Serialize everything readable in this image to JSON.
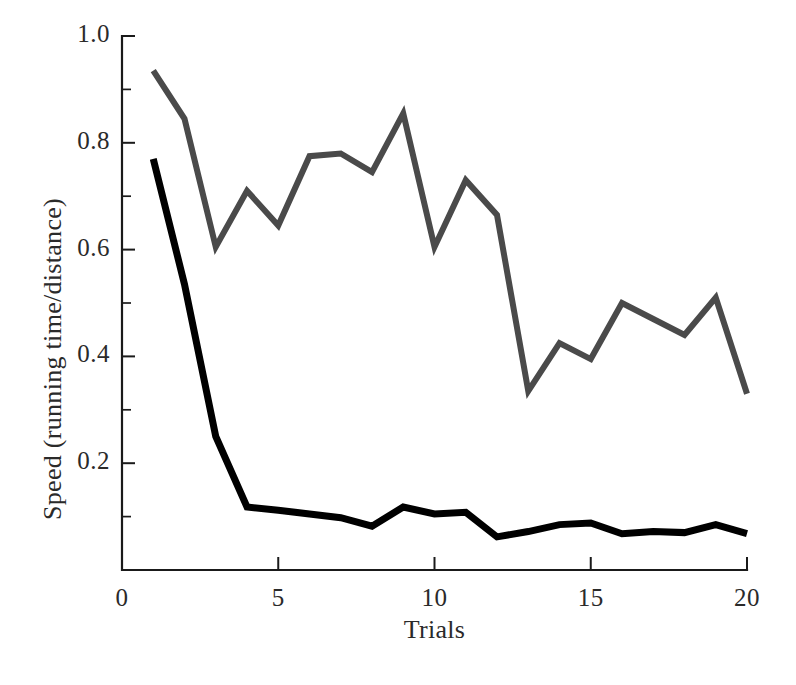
{
  "chart_data": {
    "type": "line",
    "title": "",
    "xlabel": "Trials",
    "ylabel": "Speed (running time/distance)",
    "xlim": [
      0,
      20
    ],
    "ylim": [
      0,
      1.0
    ],
    "grid": false,
    "legend": "none",
    "x_ticks": [
      "0",
      "5",
      "10",
      "15",
      "20"
    ],
    "x_tick_values": [
      0,
      5,
      10,
      15,
      20
    ],
    "x_minor_ticks": [],
    "y_ticks": [
      "0.2",
      "0.4",
      "0.6",
      "0.8",
      "1.0"
    ],
    "y_tick_values": [
      0.2,
      0.4,
      0.6,
      0.8,
      1.0
    ],
    "y_minor_tick_values": [
      0.1,
      0.3,
      0.5,
      0.7,
      0.9
    ],
    "x": [
      1,
      2,
      3,
      4,
      5,
      6,
      7,
      8,
      9,
      10,
      11,
      12,
      13,
      14,
      15,
      16,
      17,
      18,
      19,
      20
    ],
    "series": [
      {
        "name": "upper-gray-series",
        "color": "#4a4a4a",
        "stroke_width": 6,
        "values": [
          0.935,
          0.845,
          0.605,
          0.71,
          0.645,
          0.775,
          0.78,
          0.745,
          0.855,
          0.605,
          0.73,
          0.665,
          0.335,
          0.425,
          0.395,
          0.5,
          0.47,
          0.44,
          0.51,
          0.33
        ]
      },
      {
        "name": "lower-black-series",
        "color": "#000000",
        "stroke_width": 7,
        "values": [
          0.77,
          0.535,
          0.25,
          0.118,
          0.112,
          0.105,
          0.098,
          0.082,
          0.118,
          0.105,
          0.108,
          0.062,
          0.072,
          0.085,
          0.088,
          0.068,
          0.072,
          0.07,
          0.085,
          0.068
        ]
      }
    ]
  },
  "axes": {
    "y_axis_title": "Speed (running time/distance)",
    "x_axis_title": "Trials"
  },
  "colors": {
    "gray_series": "#4a4a4a",
    "black_series": "#000000",
    "axis": "#1a1a1a",
    "background": "#ffffff"
  }
}
